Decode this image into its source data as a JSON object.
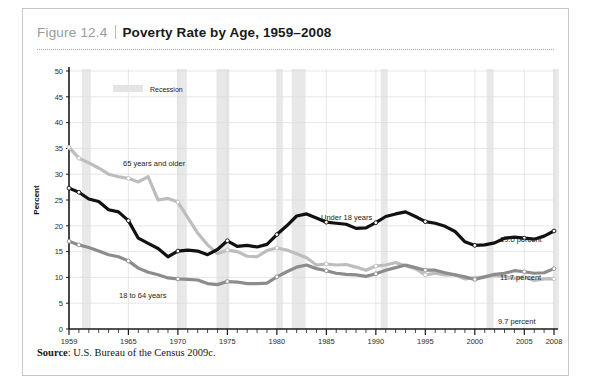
{
  "figure": {
    "number": "Figure 12.4",
    "separator": "|",
    "title": "Poverty Rate by Age, 1959–2008",
    "source_label": "Source",
    "source_text": ": U.S. Bureau of the Census 2009c."
  },
  "legend": {
    "recession_label": "Recession",
    "recession_color": "#e4e4e4"
  },
  "labels": {
    "series_65": "65 years and older",
    "series_under18": "Under 18 years",
    "series_18to64": "18 to 64 years",
    "end_under18": "19.0 percent",
    "end_18to64": "11.7 percent",
    "end_65": "9.7 percent",
    "ylabel": "Percent"
  },
  "colors": {
    "under18": "#111111",
    "age18to64": "#8c8c8c",
    "age65plus": "#bdbdbd",
    "grid": "#dcdcdc",
    "axis": "#1a1a1a",
    "recession_band": "#e8e8e8"
  },
  "chart_data": {
    "type": "line",
    "title": "Poverty Rate by Age, 1959–2008",
    "xlabel": "",
    "ylabel": "Percent",
    "xlim": [
      1959,
      2008
    ],
    "ylim": [
      0,
      50
    ],
    "yticks": [
      0,
      5,
      10,
      15,
      20,
      25,
      30,
      35,
      40,
      45,
      50
    ],
    "xticks": [
      1959,
      1965,
      1970,
      1975,
      1980,
      1985,
      1990,
      1995,
      2000,
      2005,
      2008
    ],
    "xtick_minor_step": 1,
    "grid": "horizontal-and-vertical-at-major",
    "legend": "Recession",
    "legend_position": "top-left-inside",
    "x": [
      1959,
      1960,
      1961,
      1962,
      1963,
      1964,
      1965,
      1966,
      1967,
      1968,
      1969,
      1970,
      1971,
      1972,
      1973,
      1974,
      1975,
      1976,
      1977,
      1978,
      1979,
      1980,
      1981,
      1982,
      1983,
      1984,
      1985,
      1986,
      1987,
      1988,
      1989,
      1990,
      1991,
      1992,
      1993,
      1994,
      1995,
      1996,
      1997,
      1998,
      1999,
      2000,
      2001,
      2002,
      2003,
      2004,
      2005,
      2006,
      2007,
      2008
    ],
    "series": [
      {
        "name": "Under 18 years",
        "color": "#111111",
        "end_value": 19.0,
        "values": [
          27.3,
          26.5,
          25.2,
          24.7,
          23.1,
          22.7,
          21.0,
          17.6,
          16.6,
          15.6,
          14.0,
          15.1,
          15.3,
          15.1,
          14.4,
          15.4,
          17.1,
          16.0,
          16.2,
          15.9,
          16.4,
          18.3,
          20.0,
          21.9,
          22.3,
          21.5,
          20.7,
          20.5,
          20.3,
          19.5,
          19.6,
          20.6,
          21.8,
          22.3,
          22.7,
          21.8,
          20.8,
          20.5,
          19.9,
          18.9,
          16.9,
          16.2,
          16.3,
          16.7,
          17.6,
          17.8,
          17.6,
          17.4,
          18.0,
          19.0
        ]
      },
      {
        "name": "18 to 64 years",
        "color": "#8c8c8c",
        "end_value": 11.7,
        "values": [
          17.0,
          16.3,
          15.8,
          15.1,
          14.4,
          14.0,
          13.2,
          11.8,
          11.0,
          10.5,
          9.9,
          9.7,
          9.6,
          9.5,
          8.8,
          8.6,
          9.2,
          9.1,
          8.8,
          8.8,
          8.9,
          10.1,
          11.1,
          12.0,
          12.4,
          11.7,
          11.3,
          10.8,
          10.6,
          10.5,
          10.2,
          10.7,
          11.4,
          11.9,
          12.4,
          11.9,
          11.4,
          11.4,
          10.9,
          10.5,
          10.1,
          9.6,
          10.1,
          10.6,
          10.8,
          11.3,
          11.1,
          10.8,
          10.9,
          11.7
        ]
      },
      {
        "name": "65 years and older",
        "color": "#bdbdbd",
        "end_value": 9.7,
        "values": [
          35.2,
          33.1,
          32.2,
          31.2,
          30.0,
          29.5,
          29.2,
          28.5,
          29.5,
          25.0,
          25.3,
          24.6,
          21.6,
          18.6,
          16.3,
          14.6,
          15.3,
          15.0,
          14.1,
          14.0,
          15.2,
          15.7,
          15.3,
          14.6,
          13.8,
          12.4,
          12.6,
          12.4,
          12.5,
          12.0,
          11.4,
          12.2,
          12.4,
          12.9,
          12.2,
          11.7,
          10.5,
          10.8,
          10.5,
          10.5,
          9.7,
          9.9,
          10.1,
          10.4,
          10.2,
          9.8,
          10.1,
          9.4,
          9.7,
          9.7
        ]
      }
    ],
    "recession_bands": [
      {
        "start": 1960.3,
        "end": 1961.2
      },
      {
        "start": 1969.9,
        "end": 1970.9
      },
      {
        "start": 1973.9,
        "end": 1975.2
      },
      {
        "start": 1980.0,
        "end": 1980.6
      },
      {
        "start": 1981.5,
        "end": 1982.9
      },
      {
        "start": 1990.5,
        "end": 1991.2
      },
      {
        "start": 2001.2,
        "end": 2001.9
      },
      {
        "start": 2007.9,
        "end": 2008.5
      }
    ],
    "markers_every_n_years": 5
  }
}
